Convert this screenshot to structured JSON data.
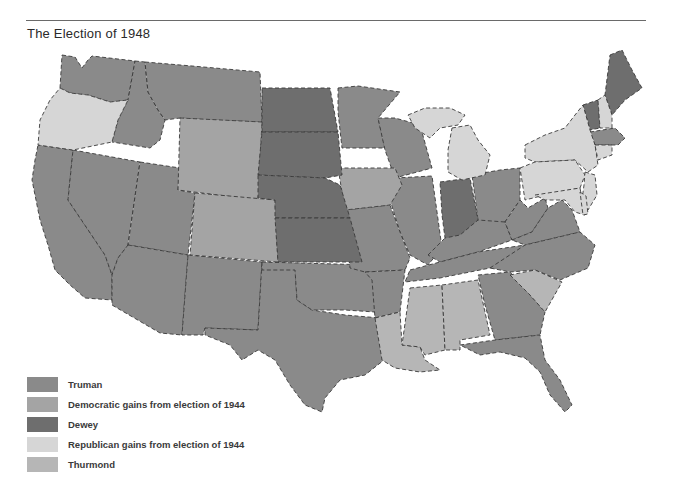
{
  "title": "The Election of 1948",
  "colors": {
    "truman": "#8a8a8a",
    "democratic_gains": "#a4a4a4",
    "dewey": "#6e6e6e",
    "republican_gains": "#d6d6d6",
    "thurmond": "#b6b6b6",
    "border": "#3a3a3a",
    "background": "#ffffff"
  },
  "legend": {
    "items": [
      {
        "key": "truman",
        "label": "Truman"
      },
      {
        "key": "democratic_gains",
        "label": "Democratic gains from election of 1944"
      },
      {
        "key": "dewey",
        "label": "Dewey"
      },
      {
        "key": "republican_gains",
        "label": "Republican gains from election of 1944"
      },
      {
        "key": "thurmond",
        "label": "Thurmond"
      }
    ]
  },
  "states": {
    "truman": [
      "Washington",
      "California",
      "Nevada",
      "Idaho",
      "Montana",
      "Utah",
      "Arizona",
      "New Mexico",
      "Texas",
      "Oklahoma",
      "Minnesota",
      "Wisconsin",
      "Illinois",
      "Missouri",
      "Arkansas",
      "Ohio",
      "Kentucky",
      "Tennessee",
      "West Virginia",
      "Virginia",
      "North Carolina",
      "Georgia",
      "Florida",
      "Massachusetts",
      "Rhode Island"
    ],
    "democratic_gains": [
      "Wyoming",
      "Colorado",
      "Iowa"
    ],
    "dewey": [
      "North Dakota",
      "South Dakota",
      "Nebraska",
      "Kansas",
      "Indiana",
      "Maine",
      "Vermont"
    ],
    "republican_gains": [
      "Oregon",
      "Michigan",
      "New York",
      "Pennsylvania",
      "New Jersey",
      "Delaware",
      "Maryland",
      "Connecticut",
      "New Hampshire"
    ],
    "thurmond": [
      "Louisiana",
      "Mississippi",
      "Alabama",
      "South Carolina"
    ]
  }
}
